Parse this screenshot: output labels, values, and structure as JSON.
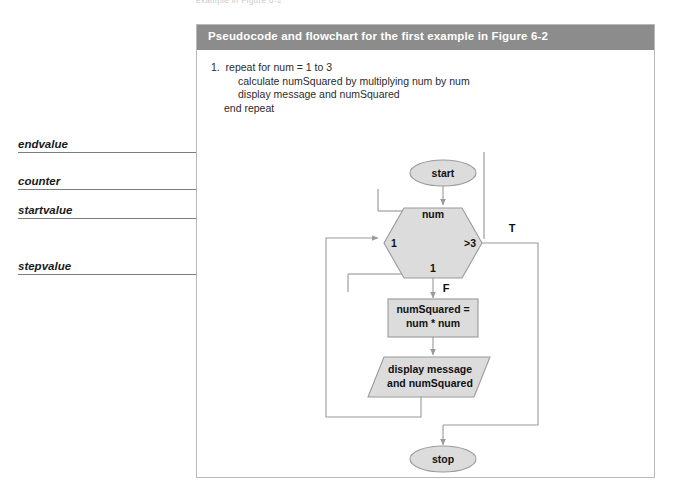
{
  "figure": {
    "top_crop_text": "example in Figure 6-2",
    "header_title": "Pseudocode and flowchart for the first example in Figure 6-2"
  },
  "pseudocode": {
    "lines": [
      "1.  repeat for num = 1 to 3",
      "calculate numSquared by multiplying num by num",
      "display message and numSquared",
      "end repeat"
    ]
  },
  "callouts": [
    {
      "label": "endvalue",
      "name": "callout-endvalue"
    },
    {
      "label": "counter",
      "name": "callout-counter"
    },
    {
      "label": "startvalue",
      "name": "callout-startvalue"
    },
    {
      "label": "stepvalue",
      "name": "callout-stepvalue"
    }
  ],
  "flowchart": {
    "start_label": "start",
    "stop_label": "stop",
    "loop": {
      "counter": "num",
      "startvalue": "1",
      "endvalue": ">3",
      "stepvalue": "1"
    },
    "branch_true": "T",
    "branch_false": "F",
    "process_line1": "numSquared =",
    "process_line2": "num * num",
    "output_line1": "display message",
    "output_line2": "and numSquared"
  },
  "colors": {
    "header_bar": "#8c8c8c",
    "shape_fill": "#dcdcdc",
    "shape_stroke": "#9a9a9a",
    "connector": "#9a9a9a",
    "panel_border": "#b9b9b9",
    "page_background": "#ffffff"
  }
}
